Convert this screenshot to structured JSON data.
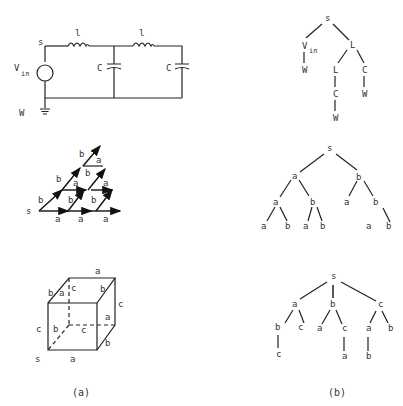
{
  "figure": {
    "panels": {
      "a": {
        "caption": "(a)",
        "circuit": {
          "labels": {
            "source": "s",
            "vin": "V",
            "vin_sub": "in",
            "ground": "W",
            "inductor1": "l",
            "inductor2": "l",
            "capacitor1": "C",
            "capacitor2": "C"
          }
        },
        "lattice": {
          "labels": {
            "source": "s",
            "a": "a",
            "b": "b"
          }
        },
        "cube": {
          "labels": {
            "source": "s",
            "a": "a",
            "b": "b",
            "c": "c"
          }
        }
      },
      "b": {
        "caption": "(b)",
        "tree1": {
          "root": "s",
          "nodes": [
            "V",
            "L",
            "W",
            "L",
            "C",
            "C",
            "W",
            "W"
          ],
          "vin_sub": "in"
        },
        "tree2": {
          "root": "s",
          "nodes": [
            "a",
            "b",
            "a",
            "b",
            "a",
            "b",
            "a",
            "b",
            "a",
            "b",
            "a",
            "b"
          ]
        },
        "tree3": {
          "root": "s",
          "nodes": [
            "a",
            "b",
            "c",
            "b",
            "c",
            "a",
            "c",
            "a",
            "b",
            "c",
            "a",
            "b"
          ]
        }
      }
    }
  }
}
